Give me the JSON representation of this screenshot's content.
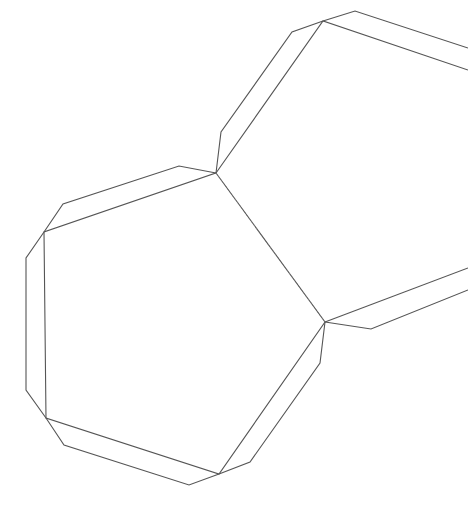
{
  "diagram": {
    "type": "papercraft-net",
    "background": "#ffffff",
    "line_color": "#555555",
    "fold_color": "#777777",
    "faces": [
      {
        "name": "main-face",
        "points": [
          [
            216,
            173
          ],
          [
            325,
            322
          ],
          [
            219,
            474
          ],
          [
            46,
            418
          ],
          [
            44,
            232
          ]
        ]
      },
      {
        "name": "upper-right-face",
        "points": [
          [
            216,
            173
          ],
          [
            323,
            21
          ],
          [
            468,
            70
          ]
        ]
      },
      {
        "name": "lower-right-face",
        "points": [
          [
            325,
            322
          ],
          [
            468,
            268
          ]
        ]
      }
    ],
    "flaps": [
      {
        "name": "flap-top-left",
        "points": [
          [
            216,
            173
          ],
          [
            179,
            166
          ],
          [
            63,
            204
          ],
          [
            44,
            232
          ]
        ]
      },
      {
        "name": "flap-left",
        "points": [
          [
            44,
            232
          ],
          [
            26,
            258
          ],
          [
            26,
            390
          ],
          [
            46,
            418
          ]
        ]
      },
      {
        "name": "flap-bottom",
        "points": [
          [
            46,
            418
          ],
          [
            64,
            445
          ],
          [
            189,
            485
          ],
          [
            219,
            474
          ]
        ]
      },
      {
        "name": "flap-bottom-right",
        "points": [
          [
            219,
            474
          ],
          [
            250,
            462
          ],
          [
            320,
            363
          ],
          [
            325,
            322
          ]
        ]
      },
      {
        "name": "flap-upper-left",
        "points": [
          [
            216,
            173
          ],
          [
            221,
            132
          ],
          [
            292,
            32
          ],
          [
            323,
            21
          ]
        ]
      },
      {
        "name": "flap-upper-top",
        "points": [
          [
            323,
            21
          ],
          [
            355,
            11
          ],
          [
            468,
            48
          ]
        ]
      },
      {
        "name": "flap-lower-right",
        "points": [
          [
            325,
            322
          ],
          [
            371,
            329
          ],
          [
            468,
            290
          ]
        ]
      }
    ],
    "fold_lines": [
      {
        "name": "fold-line-center",
        "from": [
          216,
          173
        ],
        "to": [
          325,
          322
        ]
      }
    ]
  }
}
